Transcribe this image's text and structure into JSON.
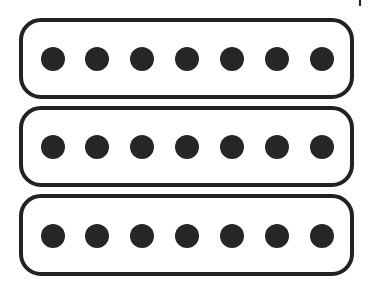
{
  "diagram": {
    "stroke_color": "#222222",
    "fill_color": "#ffffff",
    "pole_color": "#262626",
    "pickups": [
      {
        "name": "Pickup 1",
        "x": 19,
        "y": 18,
        "width": 335,
        "height": 81,
        "radius": 20,
        "poles": [
          53,
          97,
          142,
          187,
          232,
          277,
          322
        ],
        "pole_y": 59
      },
      {
        "name": "Pickup 2",
        "x": 19,
        "y": 106,
        "width": 335,
        "height": 81,
        "radius": 20,
        "poles": [
          53,
          97,
          142,
          187,
          232,
          277,
          322
        ],
        "pole_y": 147
      },
      {
        "name": "Pickup 3",
        "x": 19,
        "y": 194,
        "width": 335,
        "height": 82,
        "radius": 20,
        "poles": [
          53,
          97,
          142,
          187,
          232,
          277,
          322
        ],
        "pole_y": 236
      }
    ],
    "pole_radius": 12,
    "stroke_width": 4
  }
}
